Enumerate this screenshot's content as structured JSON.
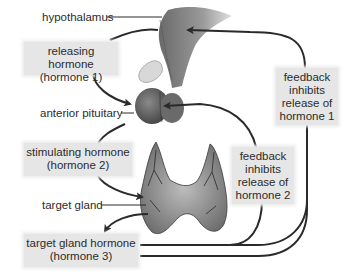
{
  "diagram": {
    "labels": {
      "hypothalamus": "hypothalamus",
      "anterior_pituitary": "anterior pituitary",
      "target_gland": "target gland"
    },
    "boxes": {
      "releasing": {
        "line1": "releasing hormone",
        "line2": "(hormone 1)"
      },
      "stimulating": {
        "line1": "stimulating hormone",
        "line2": "(hormone 2)"
      },
      "target_hormone": {
        "line1": "target gland hormone",
        "line2": "(hormone 3)"
      },
      "feedback1": {
        "line1": "feedback",
        "line2": "inhibits",
        "line3": "release of",
        "line4": "hormone 1"
      },
      "feedback2": {
        "line1": "feedback",
        "line2": "inhibits",
        "line3": "release of",
        "line4": "hormone 2"
      }
    },
    "colors": {
      "box_fill": "#e6e6e6",
      "arrow": "#2a2a2a",
      "organ_dark": "#555555",
      "organ_light": "#bfbfbf"
    }
  }
}
